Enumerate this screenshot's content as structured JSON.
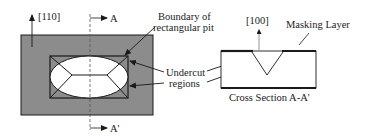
{
  "plan_view": {
    "direction_label": "[110]",
    "section_start_label": "A",
    "section_end_label": "A'",
    "boundary_label_line1": "Boundary of",
    "boundary_label_line2": "rectangular pit",
    "undercut_label_line1": "Undercut",
    "undercut_label_line2": "regions"
  },
  "cross_section": {
    "direction_label": "[100]",
    "masking_label": "Masking Layer",
    "caption": "Cross Section A-A'"
  },
  "colors": {
    "substrate_gray": "#8c8c8c",
    "line": "#1a1a1a",
    "background": "#ffffff"
  }
}
